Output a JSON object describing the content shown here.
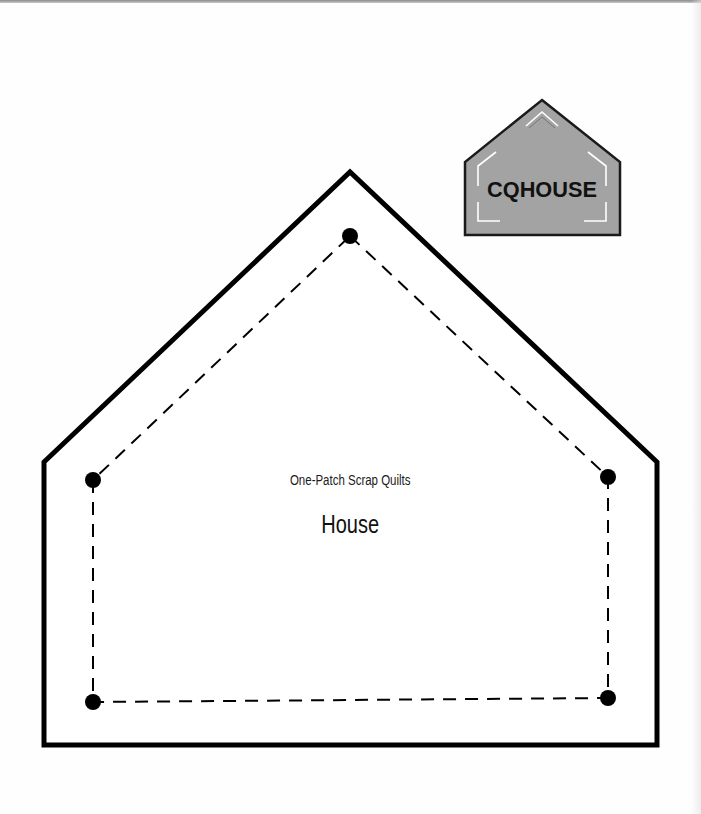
{
  "document": {
    "subtitle": "One-Patch Scrap Quilts",
    "title": "House"
  },
  "badge": {
    "label": "CQHOUSE",
    "fill_color": "#a3a3a3",
    "outline_color": "#1a1a1a"
  },
  "template": {
    "outline_color": "#000000",
    "seam_color": "#000000",
    "dot_color": "#000000",
    "outline_points": [
      [
        44,
        462
      ],
      [
        350,
        172
      ],
      [
        657,
        462
      ],
      [
        657,
        745
      ],
      [
        44,
        745
      ]
    ],
    "seam_points": [
      [
        350,
        236
      ],
      [
        608,
        477
      ],
      [
        608,
        698
      ],
      [
        93,
        702
      ],
      [
        93,
        480
      ]
    ],
    "corner_dots": [
      {
        "name": "top",
        "x": 350,
        "y": 236
      },
      {
        "name": "left-upper",
        "x": 93,
        "y": 480
      },
      {
        "name": "right-upper",
        "x": 608,
        "y": 477
      },
      {
        "name": "right-lower",
        "x": 608,
        "y": 698
      },
      {
        "name": "left-lower",
        "x": 93,
        "y": 702
      }
    ]
  }
}
